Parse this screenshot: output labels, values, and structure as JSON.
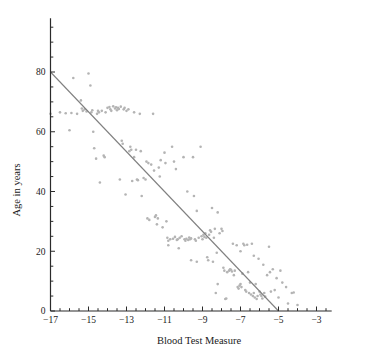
{
  "chart_data": {
    "type": "scatter",
    "title": "",
    "xlabel": "Blood Test Measure",
    "ylabel": "Age in years",
    "xlim": [
      -17.6,
      -2.2
    ],
    "ylim": [
      0,
      98
    ],
    "grid": false,
    "legend": "none",
    "point_color": "#b4b4b4",
    "point_size_px": 2.6,
    "line_color": "#808080",
    "axis_color": "#2b2b2b",
    "background": "#ffffff",
    "xticks_major": [
      -17,
      -15,
      -13,
      -11,
      -9,
      -7,
      -5,
      -3
    ],
    "xticks_major_labels": [
      "−17",
      "−15",
      "−13",
      "−11",
      "−9",
      "−7",
      "−5",
      "−3"
    ],
    "xtick_minor_step": 0.5,
    "yticks_major": [
      0,
      20,
      40,
      60,
      80
    ],
    "yticks_major_labels": [
      "0",
      "20",
      "40",
      "60",
      "80"
    ],
    "ytick_minor_step": 5,
    "trend_line": {
      "x": [
        -17,
        -5
      ],
      "y": [
        80,
        0
      ],
      "slope": -6.667,
      "intercept": -33.33
    },
    "points": [
      [
        -17.0,
        66.0
      ],
      [
        -16.5,
        66.5
      ],
      [
        -16.2,
        66.2
      ],
      [
        -16.0,
        60.5
      ],
      [
        -15.8,
        78.0
      ],
      [
        -15.9,
        66.3
      ],
      [
        -15.6,
        66.0
      ],
      [
        -15.4,
        70.5
      ],
      [
        -15.35,
        67.8
      ],
      [
        -15.3,
        67.0
      ],
      [
        -15.2,
        67.5
      ],
      [
        -15.1,
        66.8
      ],
      [
        -15.0,
        79.5
      ],
      [
        -14.9,
        75.5
      ],
      [
        -14.85,
        66.5
      ],
      [
        -14.8,
        67.2
      ],
      [
        -14.75,
        60.0
      ],
      [
        -14.7,
        54.5
      ],
      [
        -14.6,
        51.0
      ],
      [
        -14.55,
        66.0
      ],
      [
        -14.5,
        67.0
      ],
      [
        -14.45,
        66.5
      ],
      [
        -14.4,
        43.0
      ],
      [
        -14.3,
        67.0
      ],
      [
        -14.2,
        52.0
      ],
      [
        -14.15,
        51.5
      ],
      [
        -14.1,
        66.5
      ],
      [
        -14.0,
        68.0
      ],
      [
        -13.9,
        68.3
      ],
      [
        -13.85,
        67.5
      ],
      [
        -13.8,
        67.0
      ],
      [
        -13.7,
        68.5
      ],
      [
        -13.6,
        67.8
      ],
      [
        -13.55,
        68.2
      ],
      [
        -13.5,
        67.2
      ],
      [
        -13.45,
        68.0
      ],
      [
        -13.4,
        67.6
      ],
      [
        -13.35,
        44.0
      ],
      [
        -13.3,
        68.4
      ],
      [
        -13.25,
        57.0
      ],
      [
        -13.2,
        56.0
      ],
      [
        -13.15,
        67.5
      ],
      [
        -13.1,
        68.0
      ],
      [
        -13.05,
        39.0
      ],
      [
        -13.0,
        67.0
      ],
      [
        -12.9,
        67.5
      ],
      [
        -12.85,
        53.5
      ],
      [
        -12.8,
        55.0
      ],
      [
        -12.75,
        54.0
      ],
      [
        -12.7,
        43.5
      ],
      [
        -12.6,
        66.5
      ],
      [
        -12.5,
        54.0
      ],
      [
        -12.45,
        44.0
      ],
      [
        -12.4,
        43.8
      ],
      [
        -12.3,
        66.0
      ],
      [
        -12.25,
        53.5
      ],
      [
        -12.2,
        38.5
      ],
      [
        -12.1,
        44.5
      ],
      [
        -12.0,
        44.0
      ],
      [
        -11.95,
        50.0
      ],
      [
        -11.9,
        31.0
      ],
      [
        -11.85,
        49.5
      ],
      [
        -11.8,
        30.5
      ],
      [
        -11.7,
        49.0
      ],
      [
        -11.6,
        66.0
      ],
      [
        -11.55,
        47.0
      ],
      [
        -11.5,
        31.5
      ],
      [
        -11.45,
        32.0
      ],
      [
        -11.4,
        29.0
      ],
      [
        -11.35,
        31.0
      ],
      [
        -11.3,
        48.0
      ],
      [
        -11.25,
        45.0
      ],
      [
        -11.2,
        50.5
      ],
      [
        -11.1,
        28.0
      ],
      [
        -11.0,
        53.0
      ],
      [
        -10.95,
        49.5
      ],
      [
        -10.9,
        30.0
      ],
      [
        -10.85,
        24.5
      ],
      [
        -10.8,
        23.5
      ],
      [
        -10.7,
        24.0
      ],
      [
        -10.6,
        55.0
      ],
      [
        -10.55,
        24.2
      ],
      [
        -10.5,
        50.0
      ],
      [
        -10.45,
        24.8
      ],
      [
        -10.4,
        47.5
      ],
      [
        -10.35,
        23.8
      ],
      [
        -10.3,
        24.0
      ],
      [
        -10.25,
        21.0
      ],
      [
        -10.2,
        24.5
      ],
      [
        -10.1,
        25.0
      ],
      [
        -10.0,
        51.5
      ],
      [
        -9.95,
        24.0
      ],
      [
        -9.9,
        23.5
      ],
      [
        -9.85,
        24.2
      ],
      [
        -9.8,
        40.0
      ],
      [
        -9.75,
        23.8
      ],
      [
        -9.7,
        24.6
      ],
      [
        -9.65,
        24.0
      ],
      [
        -9.6,
        24.3
      ],
      [
        -9.5,
        51.5
      ],
      [
        -9.45,
        38.5
      ],
      [
        -9.4,
        24.0
      ],
      [
        -9.35,
        23.5
      ],
      [
        -9.3,
        33.5
      ],
      [
        -9.2,
        24.5
      ],
      [
        -9.1,
        55.0
      ],
      [
        -9.05,
        25.0
      ],
      [
        -9.0,
        24.0
      ],
      [
        -8.95,
        25.5
      ],
      [
        -8.9,
        24.8
      ],
      [
        -8.85,
        26.0
      ],
      [
        -8.8,
        24.5
      ],
      [
        -8.75,
        18.0
      ],
      [
        -8.7,
        17.0
      ],
      [
        -8.65,
        25.5
      ],
      [
        -8.6,
        27.0
      ],
      [
        -8.55,
        26.5
      ],
      [
        -8.5,
        34.5
      ],
      [
        -8.45,
        16.5
      ],
      [
        -8.4,
        24.5
      ],
      [
        -8.35,
        27.5
      ],
      [
        -8.3,
        6.0
      ],
      [
        -8.25,
        19.5
      ],
      [
        -8.2,
        33.0
      ],
      [
        -8.1,
        26.0
      ],
      [
        -8.0,
        27.5
      ],
      [
        -7.95,
        26.8
      ],
      [
        -7.9,
        14.5
      ],
      [
        -7.85,
        13.5
      ],
      [
        -7.8,
        4.0
      ],
      [
        -7.75,
        4.2
      ],
      [
        -7.7,
        13.0
      ],
      [
        -7.6,
        13.5
      ],
      [
        -7.55,
        14.0
      ],
      [
        -7.5,
        13.8
      ],
      [
        -7.45,
        13.2
      ],
      [
        -7.4,
        22.5
      ],
      [
        -7.35,
        12.0
      ],
      [
        -7.3,
        13.5
      ],
      [
        -7.2,
        22.0
      ],
      [
        -7.15,
        8.0
      ],
      [
        -7.1,
        7.5
      ],
      [
        -7.05,
        8.5
      ],
      [
        -7.0,
        9.0
      ],
      [
        -6.95,
        8.0
      ],
      [
        -6.9,
        12.5
      ],
      [
        -6.85,
        22.5
      ],
      [
        -6.8,
        22.0
      ],
      [
        -6.75,
        7.0
      ],
      [
        -6.7,
        6.5
      ],
      [
        -6.65,
        22.2
      ],
      [
        -6.6,
        13.0
      ],
      [
        -6.55,
        6.0
      ],
      [
        -6.5,
        9.5
      ],
      [
        -6.45,
        5.5
      ],
      [
        -6.4,
        22.5
      ],
      [
        -6.35,
        5.0
      ],
      [
        -6.3,
        6.0
      ],
      [
        -6.25,
        4.5
      ],
      [
        -6.2,
        9.0
      ],
      [
        -6.15,
        4.0
      ],
      [
        -6.1,
        5.0
      ],
      [
        -6.05,
        17.5
      ],
      [
        -6.0,
        6.5
      ],
      [
        -5.95,
        5.5
      ],
      [
        -5.9,
        5.0
      ],
      [
        -5.85,
        4.2
      ],
      [
        -5.8,
        15.5
      ],
      [
        -5.75,
        6.0
      ],
      [
        -5.7,
        4.8
      ],
      [
        -5.6,
        12.0
      ],
      [
        -5.5,
        21.5
      ],
      [
        -5.45,
        13.0
      ],
      [
        -5.4,
        6.5
      ],
      [
        -5.3,
        14.0
      ],
      [
        -5.2,
        7.0
      ],
      [
        -5.1,
        11.0
      ],
      [
        -5.0,
        4.5
      ],
      [
        -4.9,
        13.5
      ],
      [
        -4.8,
        9.5
      ],
      [
        -4.6,
        8.0
      ],
      [
        -4.5,
        2.5
      ],
      [
        -4.3,
        6.0
      ],
      [
        -4.2,
        6.2
      ],
      [
        -4.0,
        2.0
      ],
      [
        -6.3,
        18.5
      ],
      [
        -7.0,
        20.0
      ],
      [
        -8.2,
        9.0
      ],
      [
        -9.3,
        16.5
      ],
      [
        -9.6,
        17.0
      ],
      [
        -10.8,
        22.0
      ],
      [
        -12.6,
        51.5
      ]
    ]
  }
}
